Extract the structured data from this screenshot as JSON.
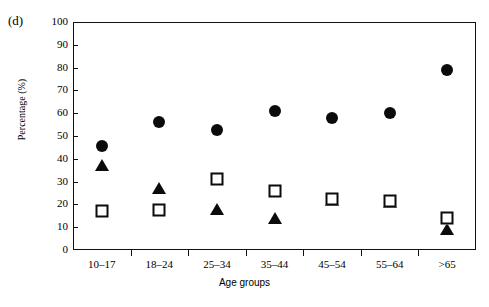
{
  "panel": {
    "label": "(d)"
  },
  "chart_data": {
    "type": "scatter",
    "title": "",
    "subtitle": "",
    "xlabel": "Age groups",
    "ylabel": "Percentage (%)",
    "categories": [
      "10–17",
      "18–24",
      "25–34",
      "35–44",
      "45–54",
      "55–64",
      ">65"
    ],
    "ylim": [
      0,
      100
    ],
    "yticks": [
      0,
      10,
      20,
      30,
      40,
      50,
      60,
      70,
      80,
      90,
      100
    ],
    "ytick_labels": [
      "0",
      "10",
      "20",
      "30",
      "40",
      "50",
      "60",
      "70",
      "80",
      "90",
      "100"
    ],
    "grid": false,
    "legend": "none",
    "series": [
      {
        "name": "filled-circle",
        "marker": "circle",
        "values": [
          45.5,
          56,
          52.5,
          61,
          58,
          60,
          79
        ]
      },
      {
        "name": "filled-triangle",
        "marker": "triangle",
        "values": [
          37.5,
          27,
          18,
          14,
          22,
          21,
          9
        ]
      },
      {
        "name": "open-square",
        "marker": "square",
        "values": [
          17,
          17.5,
          31,
          26,
          22.5,
          21.5,
          14
        ]
      }
    ]
  }
}
